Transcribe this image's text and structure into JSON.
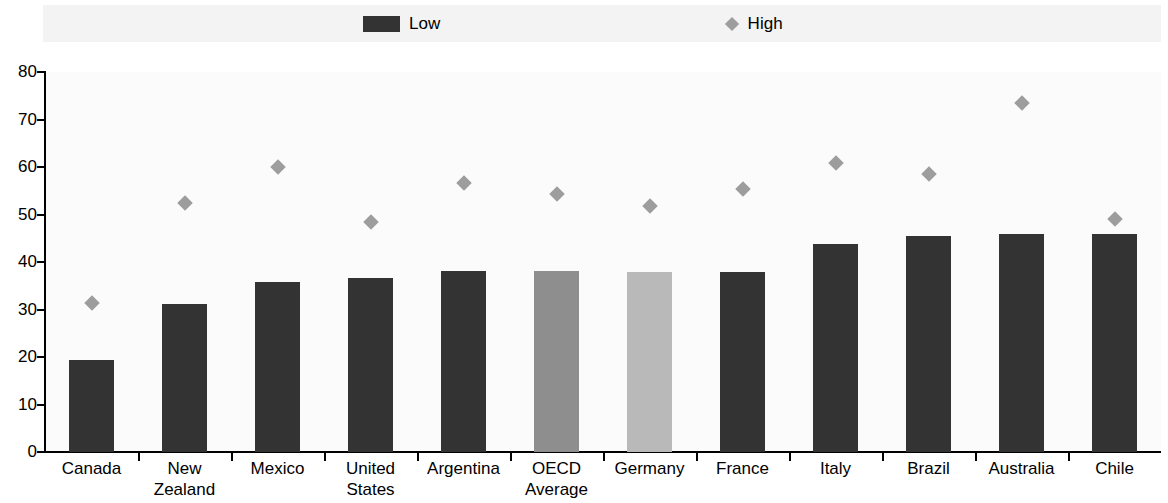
{
  "legend": {
    "low": {
      "label": "Low",
      "marker": "filled-rect-icon",
      "color": "#333333"
    },
    "high": {
      "label": "High",
      "marker": "diamond-icon",
      "color": "#9d9d9d"
    }
  },
  "axis": {
    "y_ticks": [
      "80",
      "70",
      "60",
      "50",
      "40",
      "30",
      "20",
      "10",
      "0"
    ]
  },
  "chart_data": {
    "type": "bar",
    "title": "",
    "xlabel": "",
    "ylabel": "",
    "ylim": [
      0,
      80
    ],
    "ytick_step": 10,
    "grid": false,
    "legend_position": "top",
    "categories": [
      "Canada",
      "New Zealand",
      "Mexico",
      "United States",
      "Argentina",
      "OECD\nAverage",
      "Germany",
      "France",
      "Italy",
      "Brazil",
      "Australia",
      "Chile"
    ],
    "category_labels": [
      [
        "Canada"
      ],
      [
        "New Zealand"
      ],
      [
        "Mexico"
      ],
      [
        "United States"
      ],
      [
        "Argentina"
      ],
      [
        "OECD",
        "Average"
      ],
      [
        "Germany"
      ],
      [
        "France"
      ],
      [
        "Italy"
      ],
      [
        "Brazil"
      ],
      [
        "Australia"
      ],
      [
        "Chile"
      ]
    ],
    "series": [
      {
        "name": "Low",
        "marker": "bar",
        "color": "#333333",
        "values": [
          19.3,
          31.1,
          35.8,
          36.7,
          38.1,
          38.2,
          38.0,
          37.9,
          43.7,
          45.5,
          46.0,
          45.9
        ]
      },
      {
        "name": "High",
        "marker": "diamond",
        "color": "#9d9d9d",
        "values": [
          31.4,
          52.4,
          60.1,
          48.4,
          56.6,
          54.4,
          51.7,
          55.3,
          60.9,
          58.5,
          73.4,
          49.0
        ]
      }
    ],
    "bar_colors": [
      "#333333",
      "#333333",
      "#333333",
      "#333333",
      "#333333",
      "#8e8e8e",
      "#b9b9b9",
      "#333333",
      "#333333",
      "#333333",
      "#333333",
      "#333333"
    ]
  }
}
